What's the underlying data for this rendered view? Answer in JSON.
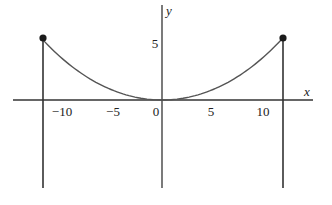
{
  "chart_data": {
    "type": "line",
    "title": "",
    "xlabel": "x",
    "ylabel": "y",
    "x_ticks": [
      -10,
      -5,
      0,
      5,
      10
    ],
    "x_tick_labels": [
      "−10",
      "−5",
      "0",
      "5",
      "10"
    ],
    "y_ticks": [
      5
    ],
    "y_tick_labels": [
      "5"
    ],
    "xlim": [
      -14.5,
      14.5
    ],
    "ylim": [
      -8,
      8.5
    ],
    "grid": false,
    "legend": null,
    "series": [
      {
        "name": "catenary curve",
        "function": "y = 13*cosh(x/13) - 13",
        "x_range": [
          -11.5,
          11.5
        ],
        "x": [
          -11.5,
          -10,
          -7.5,
          -5,
          -2.5,
          0,
          2.5,
          5,
          7.5,
          10,
          11.5
        ],
        "y": [
          5.4,
          4.0,
          2.2,
          1.0,
          0.24,
          0,
          0.24,
          1.0,
          2.2,
          4.0,
          5.4
        ]
      }
    ],
    "endpoints": [
      {
        "x": -11.5,
        "y": 5.4,
        "marker": "filled-circle"
      },
      {
        "x": 11.5,
        "y": 5.4,
        "marker": "filled-circle"
      }
    ],
    "vertical_lines": [
      {
        "x": -11.5,
        "from_y": 5.4,
        "to_y": -8
      },
      {
        "x": 11.5,
        "from_y": 5.4,
        "to_y": -8
      }
    ]
  },
  "axes": {
    "x_label": "x",
    "y_label": "y"
  },
  "ticks": {
    "x": [
      {
        "label": "−10",
        "value": -10
      },
      {
        "label": "−5",
        "value": -5
      },
      {
        "label": "0",
        "value": 0
      },
      {
        "label": "5",
        "value": 5
      },
      {
        "label": "10",
        "value": 10
      }
    ],
    "y": [
      {
        "label": "5",
        "value": 5
      }
    ]
  },
  "style": {
    "line_color": "#333333",
    "curve_color": "#555555",
    "marker_color": "#1a1a1a"
  }
}
